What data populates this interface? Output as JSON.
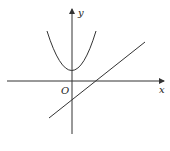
{
  "diagram": {
    "type": "coordinate-graph",
    "labels": {
      "x_axis": "x",
      "y_axis": "y",
      "origin": "O"
    },
    "curves": [
      {
        "name": "parabola",
        "kind": "quadratic",
        "opens": "up",
        "vertex_position": "positive y-axis"
      },
      {
        "name": "line",
        "kind": "linear",
        "slope": "positive",
        "y_intercept": "negative",
        "x_intercept": "positive"
      }
    ],
    "colors": {
      "stroke": "#333333",
      "background": "#ffffff"
    }
  }
}
